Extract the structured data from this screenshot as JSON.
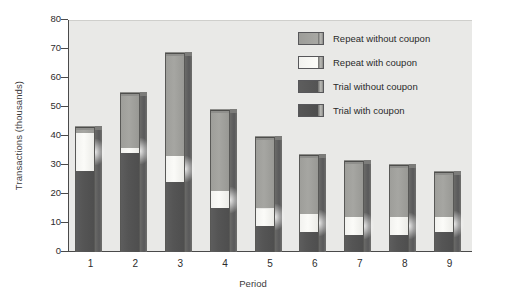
{
  "chart_data": {
    "type": "bar",
    "subtype": "stacked-bar-3d",
    "title": "",
    "xlabel": "Period",
    "ylabel": "Transactions (thousands)",
    "categories": [
      "1",
      "2",
      "3",
      "4",
      "5",
      "6",
      "7",
      "8",
      "9"
    ],
    "ylim": [
      0,
      80
    ],
    "yticks": [
      0,
      10,
      20,
      30,
      40,
      50,
      60,
      70,
      80
    ],
    "grid": false,
    "legend_position": "top-right inside plot",
    "series": [
      {
        "name": "Trial with coupon",
        "color": "#525252",
        "values": [
          28,
          34,
          24,
          15,
          9,
          7,
          6,
          6,
          7
        ]
      },
      {
        "name": "Trial without coupon",
        "color": "#5a5a5a",
        "values": [
          0,
          0,
          0,
          0,
          0,
          0,
          0,
          0,
          0
        ]
      },
      {
        "name": "Repeat with coupon",
        "color": "#f7f7f4",
        "values": [
          13,
          2,
          9,
          6,
          6,
          6,
          6,
          6,
          5
        ]
      },
      {
        "name": "Repeat without coupon",
        "color": "#a0a09c",
        "values": [
          2,
          19,
          35.5,
          28,
          24.5,
          20.5,
          19.5,
          18,
          15.5
        ]
      }
    ],
    "totals": [
      43,
      55,
      68.5,
      49,
      39.5,
      33.5,
      31.5,
      30,
      27.5
    ]
  },
  "legend": {
    "items": [
      {
        "label": "Repeat without coupon",
        "swatch": "sw-repeat-nocoupon"
      },
      {
        "label": "Repeat with coupon",
        "swatch": "sw-repeat-coupon"
      },
      {
        "label": "Trial without coupon",
        "swatch": "sw-trial-nocoupon"
      },
      {
        "label": "Trial with coupon",
        "swatch": "sw-trial-coupon"
      }
    ]
  },
  "axes": {
    "y_tick_labels": [
      "80",
      "70",
      "60",
      "50",
      "40",
      "30",
      "20",
      "10",
      "0"
    ],
    "x_tick_labels": [
      "1",
      "2",
      "3",
      "4",
      "5",
      "6",
      "7",
      "8",
      "9"
    ],
    "y_title": "Transactions (thousands)",
    "x_title": "Period"
  },
  "colors": {
    "plot_background": "#e9e9e7",
    "figure_background": "#ffffff",
    "axis": "#4a4a4a",
    "text": "#2c2c2c"
  }
}
